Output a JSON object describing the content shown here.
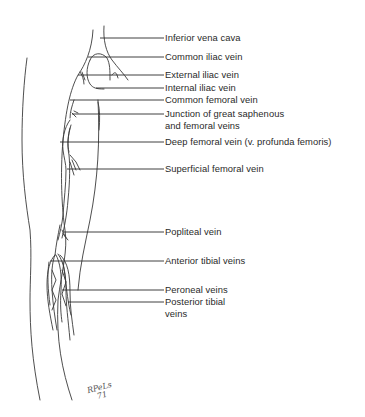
{
  "figure": {
    "labels": [
      {
        "text": "Inferior vena cava",
        "y": 38
      },
      {
        "text": "Common iliac vein",
        "y": 57
      },
      {
        "text": "External iliac vein",
        "y": 75
      },
      {
        "text": "Internal iliac vein",
        "y": 88
      },
      {
        "text": "Common femoral vein",
        "y": 100
      },
      {
        "text": "Junction of great saphenous",
        "y": 113
      },
      {
        "text": "and femoral veins",
        "y": 125
      },
      {
        "text": "Deep femoral vein (v. profunda femoris)",
        "y": 142
      },
      {
        "text": "Superficial femoral vein",
        "y": 168
      },
      {
        "text": "Popliteal vein",
        "y": 232
      },
      {
        "text": "Anterior tibial veins",
        "y": 261
      },
      {
        "text": "Peroneal veins",
        "y": 290
      },
      {
        "text": "Posterior tibial",
        "y": 302
      },
      {
        "text": "veins",
        "y": 314
      }
    ],
    "signature": {
      "line1": "RPeLs",
      "line2": "71"
    }
  }
}
